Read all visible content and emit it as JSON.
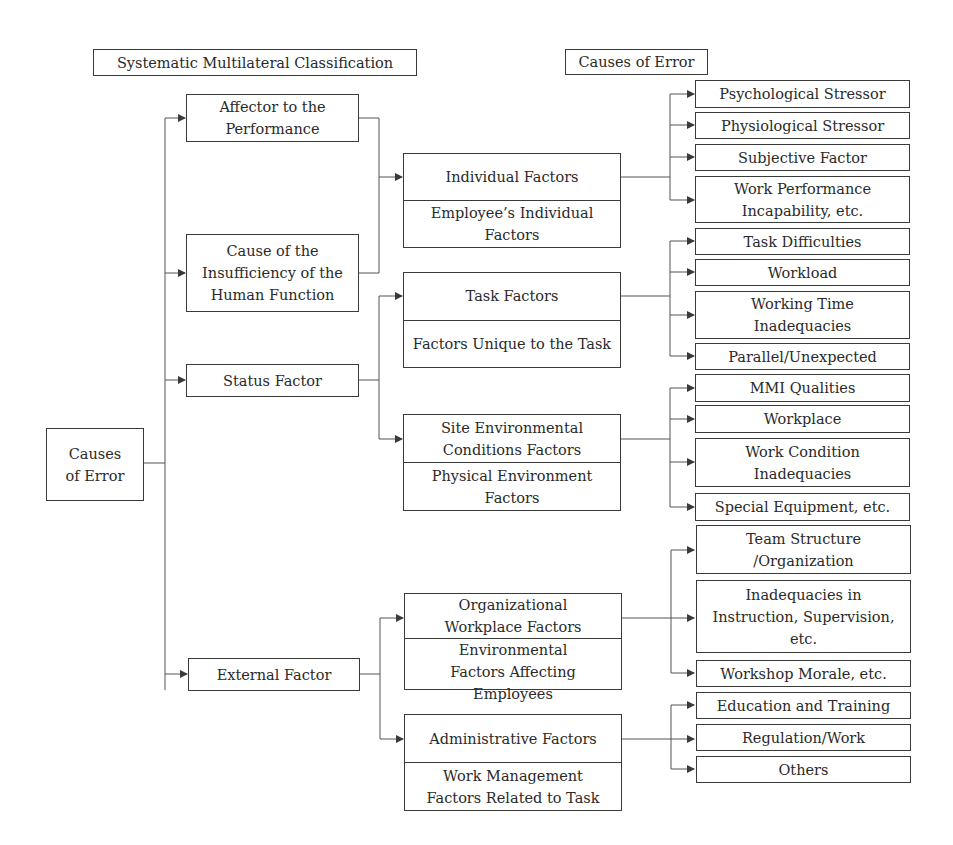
{
  "headers": {
    "left": "Systematic Multilateral Classification",
    "right": "Causes of Error"
  },
  "root": {
    "label": "Causes\nof Error"
  },
  "classification": [
    {
      "id": "affector",
      "label": "Affector to the\nPerformance"
    },
    {
      "id": "insufficiency",
      "label": "Cause of the\nInsufficiency of the\nHuman Function"
    },
    {
      "id": "status",
      "label": "Status Factor"
    },
    {
      "id": "external",
      "label": "External Factor"
    }
  ],
  "factor_groups": [
    {
      "id": "individual",
      "title": "Individual Factors",
      "subtitle": "Employee’s Individual\nFactors",
      "causes": [
        "Psychological Stressor",
        "Physiological Stressor",
        "Subjective Factor",
        "Work Performance\nIncapability, etc."
      ]
    },
    {
      "id": "task",
      "title": "Task Factors",
      "subtitle": "Factors Unique to the Task",
      "causes": [
        "Task Difficulties",
        "Workload",
        "Working Time\nInadequacies",
        "Parallel/Unexpected"
      ]
    },
    {
      "id": "site",
      "title": "Site Environmental\nConditions Factors",
      "subtitle": "Physical Environment\nFactors",
      "causes": [
        "MMI Qualities",
        "Workplace",
        "Work Condition\nInadequacies",
        "Special Equipment, etc."
      ]
    },
    {
      "id": "organizational",
      "title": "Organizational\nWorkplace Factors",
      "subtitle": "Environmental\nFactors Affecting Employees",
      "causes": [
        "Team Structure\n/Organization",
        "Inadequacies in\nInstruction, Supervision,\netc.",
        "Workshop Morale, etc."
      ]
    },
    {
      "id": "administrative",
      "title": "Administrative Factors",
      "subtitle": "Work Management\nFactors Related to Task",
      "causes": [
        "Education and Training",
        "Regulation/Work",
        "Others"
      ]
    }
  ],
  "colors": {
    "line": "#3a3a3a",
    "text": "#2a2a2a",
    "background": "#ffffff"
  }
}
